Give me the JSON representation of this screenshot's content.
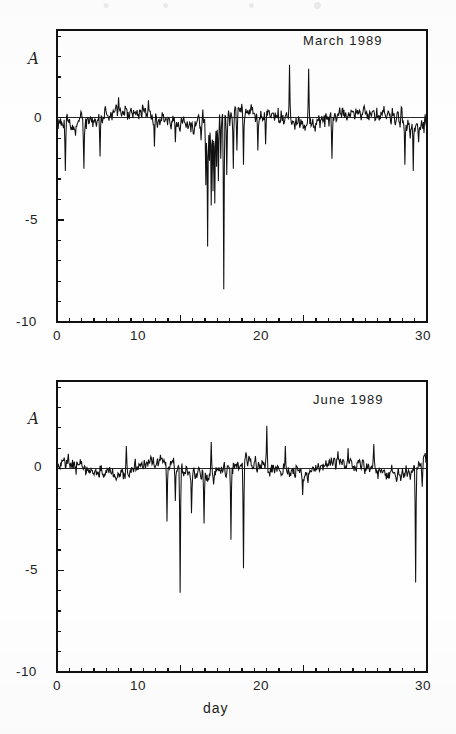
{
  "figure": {
    "background": "#fefefe",
    "ink_color": "#111111",
    "xaxis_title": "day"
  },
  "chart_data": [
    {
      "type": "line",
      "title": "March 1989",
      "xlabel": "",
      "ylabel": "A",
      "xlim": [
        0,
        30
      ],
      "ylim": [
        -10,
        4.3
      ],
      "xticks": [
        0,
        10,
        20,
        30
      ],
      "xtick_labels": [
        "0",
        "10",
        "20",
        "30"
      ],
      "yticks": [
        0,
        -5,
        -10
      ],
      "ytick_labels": [
        "0",
        "-5",
        "-10"
      ],
      "minor_ytick_step": 1,
      "grid": false,
      "legend": "none",
      "zero_line": true,
      "baseline_value": 0,
      "noise": {
        "seed": 20731,
        "samples": 620,
        "rms": 0.52,
        "drift_amp": 0.33,
        "drift_period": 9.5
      },
      "annotations": [
        {
          "label": "deep dip group days 12-14",
          "x": 13.0,
          "y": -8.4
        },
        {
          "label": "secondary dip",
          "x": 12.3,
          "y": -6.3
        }
      ],
      "events": [
        {
          "x": 0.7,
          "y": -2.6
        },
        {
          "x": 2.2,
          "y": -2.5
        },
        {
          "x": 3.5,
          "y": -1.9
        },
        {
          "x": 5.0,
          "y": 1.0
        },
        {
          "x": 7.9,
          "y": -1.4
        },
        {
          "x": 9.6,
          "y": -1.2
        },
        {
          "x": 11.7,
          "y": -1.1
        },
        {
          "x": 12.05,
          "y": -3.3
        },
        {
          "x": 12.2,
          "y": -6.3
        },
        {
          "x": 12.35,
          "y": -2.1
        },
        {
          "x": 12.5,
          "y": -4.3
        },
        {
          "x": 12.65,
          "y": -3.6
        },
        {
          "x": 12.8,
          "y": -4.2
        },
        {
          "x": 12.95,
          "y": -2.4
        },
        {
          "x": 13.1,
          "y": -3.1
        },
        {
          "x": 13.3,
          "y": -2.0
        },
        {
          "x": 13.5,
          "y": -8.4
        },
        {
          "x": 13.75,
          "y": -2.8
        },
        {
          "x": 14.0,
          "y": -0.4
        },
        {
          "x": 14.3,
          "y": -2.5
        },
        {
          "x": 14.6,
          "y": -1.6
        },
        {
          "x": 15.1,
          "y": -2.3
        },
        {
          "x": 16.3,
          "y": -1.6
        },
        {
          "x": 16.9,
          "y": -1.3
        },
        {
          "x": 18.85,
          "y": 2.6
        },
        {
          "x": 20.4,
          "y": 2.4
        },
        {
          "x": 22.3,
          "y": -2.0
        },
        {
          "x": 28.2,
          "y": -2.3
        },
        {
          "x": 28.9,
          "y": -2.6
        },
        {
          "x": 29.3,
          "y": -1.2
        }
      ]
    },
    {
      "type": "line",
      "title": "June 1989",
      "xlabel": "day",
      "ylabel": "A",
      "xlim": [
        0,
        30
      ],
      "ylim": [
        -10,
        4.3
      ],
      "xticks": [
        0,
        10,
        20,
        30
      ],
      "xtick_labels": [
        "0",
        "10",
        "20",
        "30"
      ],
      "yticks": [
        0,
        -5,
        -10
      ],
      "ytick_labels": [
        "0",
        "-5",
        "-10"
      ],
      "minor_ytick_step": 1,
      "grid": false,
      "legend": "none",
      "zero_line": true,
      "baseline_value": 0,
      "noise": {
        "seed": 48119,
        "samples": 620,
        "rms": 0.47,
        "drift_amp": 0.3,
        "drift_period": 7.5
      },
      "annotations": [
        {
          "label": "deepest spike day 10",
          "x": 10.0,
          "y": -6.1
        },
        {
          "label": "late spike day 29",
          "x": 29.1,
          "y": -5.6
        }
      ],
      "events": [
        {
          "x": 5.6,
          "y": 1.1
        },
        {
          "x": 8.9,
          "y": -2.6
        },
        {
          "x": 9.6,
          "y": -1.6
        },
        {
          "x": 10.0,
          "y": -6.1
        },
        {
          "x": 10.9,
          "y": -2.2
        },
        {
          "x": 11.9,
          "y": -2.7
        },
        {
          "x": 12.5,
          "y": 1.3
        },
        {
          "x": 14.1,
          "y": -3.5
        },
        {
          "x": 15.1,
          "y": -4.9
        },
        {
          "x": 17.0,
          "y": 2.1
        },
        {
          "x": 18.5,
          "y": 1.1
        },
        {
          "x": 19.9,
          "y": -1.3
        },
        {
          "x": 23.6,
          "y": 1.0
        },
        {
          "x": 25.7,
          "y": 1.2
        },
        {
          "x": 29.1,
          "y": -5.6
        },
        {
          "x": 29.6,
          "y": -0.9
        }
      ]
    }
  ],
  "panels": [
    {
      "id": "march",
      "title": "March 1989",
      "ylabel_glyph": "A",
      "ytick_labels": [
        "0",
        "-5",
        "-10"
      ],
      "xtick_labels": [
        "0",
        "10",
        "20",
        "30"
      ],
      "xaxis_title": ""
    },
    {
      "id": "june",
      "title": "June 1989",
      "ylabel_glyph": "A",
      "ytick_labels": [
        "0",
        "-5",
        "-10"
      ],
      "xtick_labels": [
        "0",
        "10",
        "20",
        "30"
      ],
      "xaxis_title": "day"
    }
  ]
}
